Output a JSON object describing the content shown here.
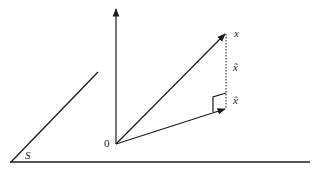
{
  "diagram": {
    "labels": {
      "origin": "0",
      "vector_x": "x",
      "vector_x_tilde": "x̃",
      "vector_x_hat": "x̂",
      "subspace": "S"
    },
    "colors": {
      "stroke": "#1a1a1a",
      "background": "#ffffff"
    }
  }
}
